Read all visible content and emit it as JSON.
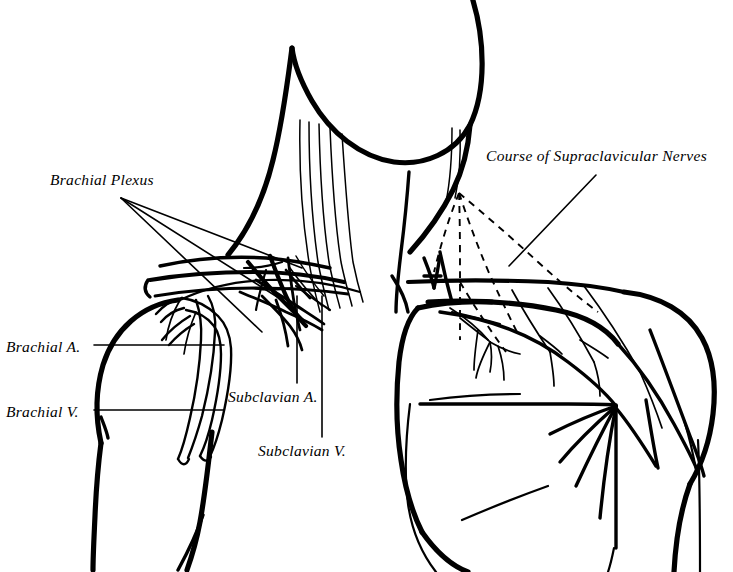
{
  "figure": {
    "kind": "anatomical-line-drawing",
    "width": 733,
    "height": 572,
    "background_color": "#ffffff",
    "ink_color": "#000000"
  },
  "labels": {
    "brachial_plexus": "Brachial Plexus",
    "brachial_artery": "Brachial A.",
    "brachial_vein": "Brachial V.",
    "subclavian_artery": "Subclavian A.",
    "subclavian_vein": "Subclavian V.",
    "supraclavicular_nerves": "Course of Supraclavicular Nerves"
  },
  "leaders": {
    "brachial_plexus": {
      "origin": [
        121,
        198
      ],
      "targets": [
        [
          300,
          268
        ],
        [
          278,
          300
        ],
        [
          258,
          330
        ]
      ]
    },
    "brachial_artery": {
      "from": [
        94,
        345
      ],
      "to": [
        222,
        345
      ]
    },
    "brachial_vein": {
      "from": [
        94,
        410
      ],
      "to": [
        222,
        410
      ]
    },
    "subclavian_artery": {
      "from": [
        297,
        383
      ],
      "to": [
        297,
        300
      ]
    },
    "subclavian_vein": {
      "from": [
        322,
        437
      ],
      "to": [
        322,
        300
      ]
    },
    "supraclavicular_nerves": {
      "from": [
        595,
        176
      ],
      "to": [
        509,
        266
      ]
    }
  },
  "regions": [
    {
      "name": "head-and-neck",
      "note": "chin, jaw and neck contour, upper centre"
    },
    {
      "name": "right-shoulder-dissected",
      "note": "viewer left: clavicle removed, plexus and vessels exposed"
    },
    {
      "name": "left-shoulder-intact",
      "note": "viewer right: intact skin with supraclavicular nerve branches"
    },
    {
      "name": "thorax",
      "note": "sternum and chest wall, lower centre"
    }
  ],
  "colors": {
    "ink": "#000000",
    "paper": "#ffffff"
  }
}
